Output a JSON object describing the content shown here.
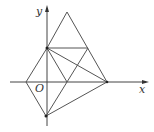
{
  "diagram": {
    "type": "coordinate-geometry",
    "axes": {
      "x_label": "x",
      "y_label": "y",
      "origin_label": "O"
    },
    "points": {
      "apex": [
        67,
        12
      ],
      "y_upper": [
        47,
        48
      ],
      "right_mid": [
        88,
        48
      ],
      "x_left": [
        26,
        82
      ],
      "x_mid": [
        67,
        82
      ],
      "x_right": [
        107,
        82
      ],
      "y_lower": [
        46,
        116
      ]
    },
    "segments": [
      [
        "apex",
        "y_upper"
      ],
      [
        "apex",
        "x_right"
      ],
      [
        "y_upper",
        "right_mid"
      ],
      [
        "y_upper",
        "x_mid"
      ],
      [
        "y_upper",
        "x_right"
      ],
      [
        "right_mid",
        "y_lower"
      ],
      [
        "x_left",
        "y_upper"
      ],
      [
        "x_left",
        "y_lower"
      ],
      [
        "y_lower",
        "x_right"
      ]
    ],
    "colors": {
      "line": "#555555",
      "axis": "#444444",
      "background": "#ffffff"
    }
  }
}
